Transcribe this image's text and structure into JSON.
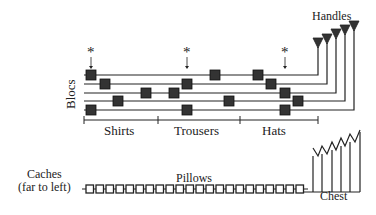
{
  "labels": {
    "handles": "Handles",
    "blocs": "Blocs",
    "shirts": "Shirts",
    "trousers": "Trousers",
    "hats": "Hats",
    "caches_line1": "Caches",
    "caches_line2": "(far to left)",
    "pillows": "Pillows",
    "chest": "Chest",
    "asterisk": "*"
  },
  "colors": {
    "ink": "#222222",
    "square_fill": "#333333",
    "background": "#ffffff"
  },
  "lines": [
    {
      "y": 75,
      "end_x": 318,
      "handle_y": 41,
      "squares": [
        91,
        215,
        258
      ]
    },
    {
      "y": 84,
      "end_x": 327,
      "handle_y": 37,
      "squares": [
        105,
        187,
        271
      ]
    },
    {
      "y": 93,
      "end_x": 336,
      "handle_y": 32,
      "squares": [
        146,
        174,
        285
      ]
    },
    {
      "y": 101,
      "end_x": 345,
      "handle_y": 28,
      "squares": [
        118,
        229,
        298
      ]
    },
    {
      "y": 110,
      "end_x": 354,
      "handle_y": 24,
      "squares": [
        91,
        187,
        285
      ]
    }
  ],
  "markers": [
    91,
    187,
    285
  ],
  "pillows": {
    "count": 22,
    "start_x": 86,
    "y": 189,
    "pitch": 10
  }
}
